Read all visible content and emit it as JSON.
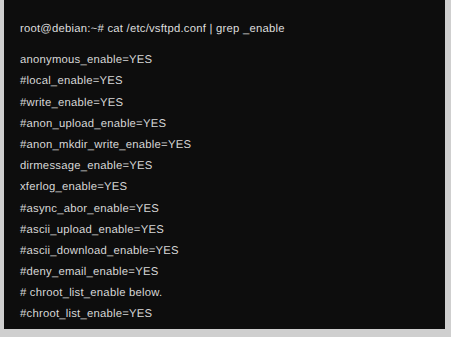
{
  "terminal": {
    "background_color": "#0d0d0d",
    "text_color": "#d7d7d7",
    "outer_background_color": "#cfcfcf",
    "prompt": {
      "user": "root",
      "host": "debian",
      "path": "~",
      "symbol": "#",
      "full": "root@debian:~#",
      "command": "cat /etc/vsftpd.conf | grep _enable",
      "line": "root@debian:~# cat /etc/vsftpd.conf | grep _enable"
    },
    "output_lines": [
      "anonymous_enable=YES",
      "#local_enable=YES",
      "#write_enable=YES",
      "#anon_upload_enable=YES",
      "#anon_mkdir_write_enable=YES",
      "dirmessage_enable=YES",
      "xferlog_enable=YES",
      "#async_abor_enable=YES",
      "#ascii_upload_enable=YES",
      "#ascii_download_enable=YES",
      "#deny_email_enable=YES",
      "# chroot_list_enable below.",
      "#chroot_list_enable=YES",
      "#ls_recurse_enable=YES"
    ]
  }
}
